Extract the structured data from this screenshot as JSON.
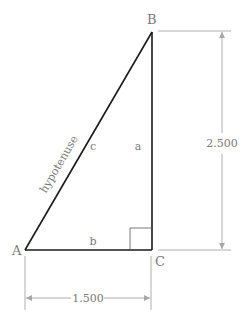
{
  "diagram": {
    "type": "right-triangle",
    "vertices": [
      {
        "id": "A",
        "label": "A"
      },
      {
        "id": "B",
        "label": "B"
      },
      {
        "id": "C",
        "label": "C"
      }
    ],
    "sides": {
      "a": {
        "label": "a"
      },
      "b": {
        "label": "b"
      },
      "c": {
        "label": "c"
      }
    },
    "hypotenuse_label": "hypotenuse",
    "dimensions": {
      "vertical": {
        "value": "2.500"
      },
      "horizontal": {
        "value": "1.500"
      }
    },
    "colors": {
      "triangle": "#1a1a1a",
      "dimension": "#a6a6a6",
      "text": "#7a7a7a"
    }
  }
}
